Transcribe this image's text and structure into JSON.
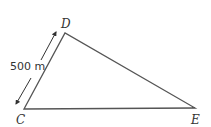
{
  "diagram": {
    "type": "triangle",
    "vertices": [
      {
        "name": "C",
        "x": 24,
        "y": 109
      },
      {
        "name": "D",
        "x": 65,
        "y": 33
      },
      {
        "name": "E",
        "x": 195,
        "y": 108
      }
    ],
    "labels": {
      "C": "C",
      "D": "D",
      "E": "E"
    },
    "measurements": {
      "CD": "500 m"
    },
    "colors": {
      "line": "#555555",
      "text": "#333333"
    }
  }
}
